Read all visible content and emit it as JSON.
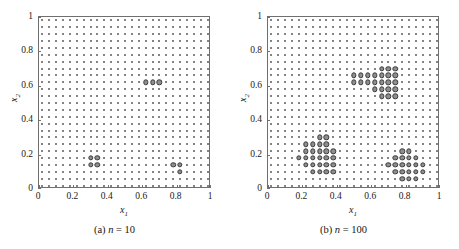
{
  "figure": {
    "type": "two-panel-scatter-figure",
    "panels": [
      {
        "id": "a",
        "caption_prefix": "(a)",
        "caption_symbol": "n",
        "caption_equals": "=",
        "caption_value": "10",
        "caption_text": "(a) n = 10"
      },
      {
        "id": "b",
        "caption_prefix": "(b)",
        "caption_symbol": "n",
        "caption_equals": "=",
        "caption_value": "100",
        "caption_text": "(b) n = 100"
      }
    ]
  },
  "axes": {
    "xlabel_base": "x",
    "xlabel_sub": "1",
    "ylabel_base": "x",
    "ylabel_sub": "2",
    "xticks": [
      "0",
      "0.2",
      "0.4",
      "0.6",
      "0.8",
      "1"
    ],
    "yticks": [
      "0",
      "0.2",
      "0.4",
      "0.6",
      "0.8",
      "1"
    ],
    "xtick_values": [
      0,
      0.2,
      0.4,
      0.6,
      0.8,
      1
    ],
    "ytick_values": [
      0,
      0.2,
      0.4,
      0.6,
      0.8,
      1
    ],
    "xlim": [
      0,
      1
    ],
    "ylim": [
      0,
      1
    ]
  },
  "colors": {
    "frame": "#6f6f6f",
    "base_dot": "#5b5b5b",
    "selected_fill": "#8e8e8e",
    "selected_edge": "#3a3a3a",
    "background": "#ffffff",
    "text": "#1a1a1a"
  },
  "chart_data": [
    {
      "type": "scatter",
      "panel": "a",
      "title": "(a) n = 10",
      "subtitle": "",
      "xlabel": "x_1",
      "ylabel": "x_2",
      "xlim": [
        0,
        1
      ],
      "ylim": [
        0,
        1
      ],
      "grid": false,
      "legend": "none",
      "series": [
        {
          "name": "candidate grid",
          "marker": "small dot",
          "description": "25 x 25 uniform lattice of candidate design points spanning 0.02 to 0.98 in both coordinates",
          "grid_nx": 25,
          "grid_ny": 25,
          "grid_x_start": 0.02,
          "grid_x_step": 0.04,
          "grid_y_start": 0.02,
          "grid_y_step": 0.04,
          "count": 625
        },
        {
          "name": "selected points",
          "marker": "large filled circle",
          "count": 10,
          "x": [
            0.3,
            0.34,
            0.3,
            0.34,
            0.62,
            0.66,
            0.7,
            0.78,
            0.82,
            0.82
          ],
          "y": [
            0.18,
            0.18,
            0.14,
            0.14,
            0.62,
            0.62,
            0.62,
            0.14,
            0.14,
            0.1
          ]
        }
      ]
    },
    {
      "type": "scatter",
      "panel": "b",
      "title": "(b) n = 100",
      "subtitle": "",
      "xlabel": "x_1",
      "ylabel": "x_2",
      "xlim": [
        0,
        1
      ],
      "ylim": [
        0,
        1
      ],
      "grid": false,
      "legend": "none",
      "series": [
        {
          "name": "candidate grid",
          "marker": "small dot",
          "description": "25 x 25 uniform lattice of candidate design points spanning 0.02 to 0.98 in both coordinates",
          "grid_nx": 25,
          "grid_ny": 25,
          "grid_x_start": 0.02,
          "grid_x_step": 0.04,
          "grid_y_start": 0.02,
          "grid_y_step": 0.04,
          "count": 625
        },
        {
          "name": "selected points",
          "marker": "large filled circle",
          "count": 100,
          "x": [
            0.66,
            0.7,
            0.74,
            0.5,
            0.54,
            0.58,
            0.62,
            0.66,
            0.7,
            0.74,
            0.5,
            0.54,
            0.58,
            0.62,
            0.66,
            0.7,
            0.74,
            0.62,
            0.66,
            0.7,
            0.74,
            0.66,
            0.7,
            0.74,
            0.3,
            0.34,
            0.22,
            0.26,
            0.3,
            0.34,
            0.22,
            0.26,
            0.3,
            0.34,
            0.38,
            0.18,
            0.22,
            0.26,
            0.3,
            0.34,
            0.38,
            0.22,
            0.26,
            0.3,
            0.34,
            0.38,
            0.26,
            0.3,
            0.34,
            0.38,
            0.78,
            0.82,
            0.74,
            0.78,
            0.82,
            0.86,
            0.7,
            0.74,
            0.78,
            0.82,
            0.86,
            0.9,
            0.74,
            0.78,
            0.82,
            0.86,
            0.9,
            0.78,
            0.82,
            0.86
          ],
          "y": [
            0.7,
            0.7,
            0.7,
            0.66,
            0.66,
            0.66,
            0.66,
            0.66,
            0.66,
            0.66,
            0.62,
            0.62,
            0.62,
            0.62,
            0.62,
            0.62,
            0.62,
            0.58,
            0.58,
            0.58,
            0.58,
            0.54,
            0.54,
            0.54,
            0.3,
            0.3,
            0.26,
            0.26,
            0.26,
            0.26,
            0.22,
            0.22,
            0.22,
            0.22,
            0.22,
            0.18,
            0.18,
            0.18,
            0.18,
            0.18,
            0.18,
            0.14,
            0.14,
            0.14,
            0.14,
            0.14,
            0.1,
            0.1,
            0.1,
            0.1,
            0.22,
            0.22,
            0.18,
            0.18,
            0.18,
            0.18,
            0.14,
            0.14,
            0.14,
            0.14,
            0.14,
            0.14,
            0.1,
            0.1,
            0.1,
            0.1,
            0.1,
            0.06,
            0.06,
            0.06
          ]
        }
      ]
    }
  ]
}
